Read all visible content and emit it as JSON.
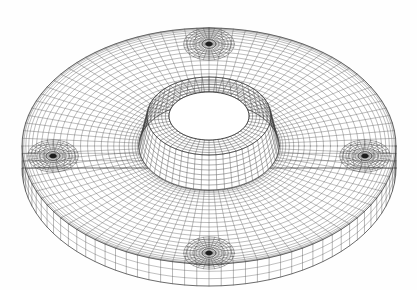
{
  "view": {
    "background_color": "#ffffff",
    "line_color": "#3a3a3a",
    "surface_color": "#ffffff",
    "width": 417,
    "height": 290,
    "caption": ""
  },
  "model": {
    "name": "annular-flange-disc-mesh",
    "description": "Wireframe finite element mesh of a circular flange disc with a raised central hub, a central through bore, and four bolt holes arranged at 90 degree spacing.",
    "element_type": "quad",
    "render_mode": "hidden-line wireframe"
  },
  "chart_data": {
    "type": "mesh",
    "title": "",
    "projection": "isometric-perspective",
    "center": {
      "x": 209,
      "y": 146
    },
    "outer_disc": {
      "radius_x": 187,
      "radius_y": 118,
      "thickness_px": 22,
      "circumferential_divisions": 96,
      "radial_divisions": 26,
      "thickness_divisions": 3
    },
    "hub": {
      "outer_radius_x": 70,
      "outer_radius_y": 44,
      "height_px": 30,
      "top_radius_x": 62,
      "top_radius_y": 39,
      "circumferential_divisions": 56,
      "height_divisions": 7
    },
    "bore": {
      "radius_x": 40,
      "radius_y": 24,
      "circumferential_divisions": 48,
      "depth_px": 30
    },
    "bolt_holes": [
      {
        "id": "hole-top",
        "angle_deg": 90,
        "cx": 209,
        "cy": 44,
        "rx": 11,
        "ry": 7,
        "rings": 7,
        "sectors": 28
      },
      {
        "id": "hole-left",
        "angle_deg": 180,
        "cx": 53,
        "cy": 156,
        "rx": 11,
        "ry": 7,
        "rings": 7,
        "sectors": 28
      },
      {
        "id": "hole-right",
        "angle_deg": 0,
        "cx": 365,
        "cy": 156,
        "rx": 11,
        "ry": 7,
        "rings": 7,
        "sectors": 28
      },
      {
        "id": "hole-bottom",
        "angle_deg": 270,
        "cx": 209,
        "cy": 253,
        "rx": 11,
        "ry": 7,
        "rings": 7,
        "sectors": 28
      }
    ],
    "annotations": [],
    "legend": [],
    "xlabel": "",
    "ylabel": ""
  }
}
